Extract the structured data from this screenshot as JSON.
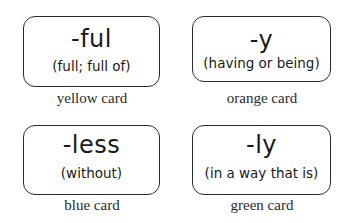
{
  "cards": [
    {
      "suffix": "-ful",
      "meaning": "(full; full of)",
      "label": "yellow card"
    },
    {
      "suffix": "-y",
      "meaning": "(having or being)",
      "label": "orange card"
    },
    {
      "suffix": "-less",
      "meaning": "(without)",
      "label": "blue card"
    },
    {
      "suffix": "-ly",
      "meaning": "(in a way that is)",
      "label": "green card"
    }
  ]
}
